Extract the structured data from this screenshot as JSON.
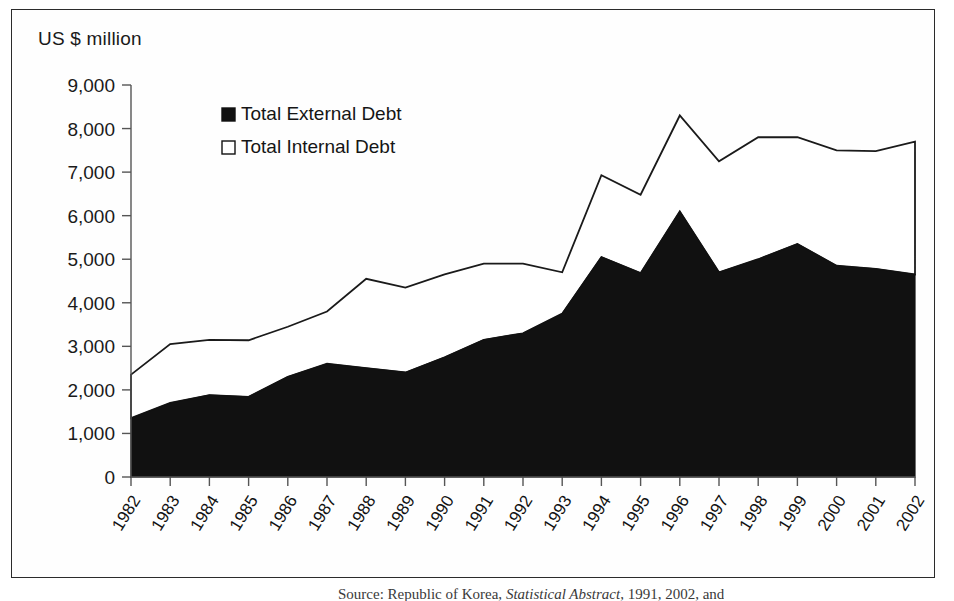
{
  "figure": {
    "axis_unit_label": "US $ million",
    "source_caption_prefix": "Source: Republic of Korea, ",
    "source_caption_italic": "Statistical Abstract",
    "source_caption_suffix": ", 1991, 2002, and",
    "frame_color": "#2b2b2b",
    "background": "#ffffff"
  },
  "legend": {
    "position": "top-left-inside",
    "entries": [
      {
        "label": "Total External Debt",
        "marker": "filled-square",
        "color": "#111111"
      },
      {
        "label": "Total Internal Debt",
        "marker": "open-square",
        "color": "#ffffff"
      }
    ]
  },
  "chart_data": {
    "type": "area",
    "stacked": true,
    "title": "",
    "xlabel": "",
    "ylabel": "US $ million",
    "ylim": [
      0,
      9000
    ],
    "ytick_step": 1000,
    "grid": false,
    "yticks": [
      "0",
      "1,000",
      "2,000",
      "3,000",
      "4,000",
      "5,000",
      "6,000",
      "7,000",
      "8,000",
      "9,000"
    ],
    "categories": [
      "1982",
      "1983",
      "1984",
      "1985",
      "1986",
      "1987",
      "1988",
      "1989",
      "1990",
      "1991",
      "1992",
      "1993",
      "1994",
      "1995",
      "1996",
      "1997",
      "1998",
      "1999",
      "2000",
      "2001",
      "2002"
    ],
    "series": [
      {
        "name": "Total External Debt",
        "fill": "#111111",
        "values": [
          1350,
          1700,
          1880,
          1840,
          2300,
          2600,
          2500,
          2400,
          2750,
          3150,
          3300,
          3750,
          5050,
          4680,
          6100,
          4700,
          5000,
          5350,
          4850,
          4780,
          4650
        ]
      },
      {
        "name": "Total Internal Debt",
        "fill": "#ffffff",
        "values": [
          1000,
          1350,
          1270,
          1300,
          1150,
          1200,
          2050,
          1950,
          1900,
          1750,
          1600,
          950,
          1880,
          1800,
          2200,
          2550,
          2800,
          2450,
          2650,
          2700,
          3050
        ]
      }
    ],
    "totals": [
      2350,
      3050,
      3150,
      3140,
      3450,
      3800,
      4550,
      4350,
      4650,
      4900,
      4900,
      4700,
      6930,
      6480,
      8300,
      7250,
      7800,
      7800,
      7500,
      7480,
      7700
    ]
  }
}
